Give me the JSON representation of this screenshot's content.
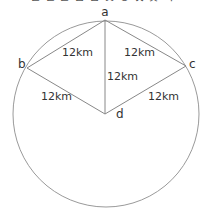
{
  "diagram": {
    "top_cutoff_text": "ㄴ ㄷ ㄹ ㅁ ㅂ ㅅ ㅇ ㅈ ㅊ ㅋ",
    "points": {
      "a": {
        "label": "a"
      },
      "b": {
        "label": "b"
      },
      "c": {
        "label": "c"
      },
      "d": {
        "label": "d"
      }
    },
    "edges": [
      {
        "from": "a",
        "to": "b",
        "label": "12km"
      },
      {
        "from": "a",
        "to": "c",
        "label": "12km"
      },
      {
        "from": "a",
        "to": "d",
        "label": "12km"
      },
      {
        "from": "b",
        "to": "d",
        "label": "12km"
      },
      {
        "from": "c",
        "to": "d",
        "label": "12km"
      }
    ],
    "circle": {
      "center": "d",
      "stroke": "#999999"
    },
    "line_color": "#888888"
  }
}
